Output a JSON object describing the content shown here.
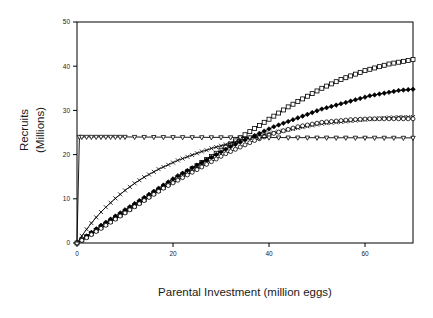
{
  "chart_data": {
    "type": "line",
    "title": "",
    "xlabel": "Parental Investment (million eggs)",
    "ylabel": "Recruits (Millions)",
    "ylabel_line1": "Recruits",
    "ylabel_line2": "(Millions)",
    "xlim": [
      0,
      70
    ],
    "ylim": [
      0,
      50
    ],
    "xticks": [
      0,
      20,
      40,
      60
    ],
    "yticks": [
      0,
      10,
      20,
      30,
      40,
      50
    ],
    "xtick_labels": [
      "0",
      "20",
      "40",
      "60"
    ],
    "ytick_labels": [
      "0",
      "10",
      "20",
      "30",
      "40",
      "50"
    ],
    "grid": false,
    "legend": "none",
    "frame": "box",
    "line_color": "#000000",
    "series": [
      {
        "name": "open-squares",
        "marker": "square-open",
        "x": [
          0,
          1,
          2,
          3,
          4,
          5,
          6,
          7,
          8,
          9,
          10,
          11,
          12,
          13,
          14,
          15,
          16,
          17,
          18,
          19,
          20,
          21,
          22,
          23,
          24,
          25,
          26,
          27,
          28,
          29,
          30,
          31,
          32,
          33,
          34,
          35,
          36,
          37,
          38,
          39,
          40,
          41,
          42,
          43,
          44,
          45,
          46,
          47,
          48,
          49,
          50,
          51,
          52,
          53,
          54,
          55,
          56,
          57,
          58,
          59,
          60,
          61,
          62,
          63,
          64,
          65,
          66,
          67,
          68,
          69,
          70
        ],
        "y": [
          0,
          0.7,
          1.4,
          2.1,
          2.8,
          3.5,
          4.2,
          4.9,
          5.6,
          6.3,
          7.0,
          7.7,
          8.4,
          9.1,
          9.8,
          10.5,
          11.2,
          11.9,
          12.6,
          13.3,
          14.0,
          14.7,
          15.4,
          16.1,
          16.8,
          17.5,
          18.2,
          18.9,
          19.6,
          20.3,
          21.0,
          21.7,
          22.4,
          23.1,
          23.8,
          24.5,
          25.2,
          25.9,
          26.6,
          27.3,
          28.0,
          28.7,
          29.4,
          30.1,
          30.8,
          31.4,
          32.0,
          32.6,
          33.2,
          33.8,
          34.4,
          35.0,
          35.5,
          36.0,
          36.5,
          37.0,
          37.4,
          37.8,
          38.2,
          38.6,
          39.0,
          39.3,
          39.6,
          39.9,
          40.2,
          40.5,
          40.7,
          40.9,
          41.1,
          41.3,
          41.5
        ]
      },
      {
        "name": "filled-diamonds",
        "marker": "diamond-filled",
        "x": [
          0,
          1,
          2,
          3,
          4,
          5,
          6,
          7,
          8,
          9,
          10,
          11,
          12,
          13,
          14,
          15,
          16,
          17,
          18,
          19,
          20,
          21,
          22,
          23,
          24,
          25,
          26,
          27,
          28,
          29,
          30,
          31,
          32,
          33,
          34,
          35,
          36,
          37,
          38,
          39,
          40,
          41,
          42,
          43,
          44,
          45,
          46,
          47,
          48,
          49,
          50,
          51,
          52,
          53,
          54,
          55,
          56,
          57,
          58,
          59,
          60,
          61,
          62,
          63,
          64,
          65,
          66,
          67,
          68,
          69,
          70
        ],
        "y": [
          0,
          0.8,
          1.6,
          2.4,
          3.2,
          4.0,
          4.7,
          5.4,
          6.1,
          6.8,
          7.5,
          8.2,
          8.9,
          9.6,
          10.3,
          11.0,
          11.7,
          12.4,
          13.1,
          13.8,
          14.5,
          15.2,
          15.8,
          16.4,
          17.0,
          17.6,
          18.2,
          18.8,
          19.4,
          20.0,
          20.6,
          21.2,
          21.8,
          22.3,
          22.8,
          23.3,
          23.8,
          24.3,
          24.8,
          25.3,
          25.8,
          26.3,
          26.7,
          27.1,
          27.5,
          27.9,
          28.3,
          28.7,
          29.1,
          29.5,
          29.9,
          30.3,
          30.6,
          30.9,
          31.2,
          31.5,
          31.8,
          32.1,
          32.4,
          32.7,
          33.0,
          33.3,
          33.5,
          33.7,
          33.9,
          34.1,
          34.3,
          34.5,
          34.6,
          34.7,
          34.8
        ]
      },
      {
        "name": "x-crosses",
        "marker": "x-cross",
        "x": [
          0,
          1,
          2,
          3,
          4,
          5,
          6,
          7,
          8,
          9,
          10,
          11,
          12,
          13,
          14,
          15,
          16,
          17,
          18,
          19,
          20,
          21,
          22,
          23,
          24,
          25,
          26,
          27,
          28,
          29,
          30,
          31,
          32,
          33,
          34,
          35,
          36,
          37,
          38,
          39,
          40,
          41,
          42,
          43,
          44,
          45,
          46,
          47,
          48,
          49,
          50,
          51,
          52,
          53,
          54,
          55,
          56,
          57,
          58,
          59,
          60,
          61,
          62,
          63,
          64,
          65,
          66,
          67,
          68,
          69,
          70
        ],
        "y": [
          0,
          1.6,
          3.1,
          4.5,
          5.8,
          7.0,
          8.1,
          9.1,
          10.1,
          11.0,
          11.9,
          12.7,
          13.5,
          14.2,
          14.9,
          15.5,
          16.1,
          16.7,
          17.2,
          17.7,
          18.2,
          18.7,
          19.1,
          19.5,
          19.9,
          20.3,
          20.7,
          21.0,
          21.4,
          21.7,
          22.0,
          22.3,
          22.6,
          22.9,
          23.2,
          23.5,
          23.8,
          24.0,
          24.3,
          24.5,
          24.8,
          25.0,
          25.2,
          25.4,
          25.6,
          25.8,
          26.0,
          26.2,
          26.4,
          26.6,
          26.8,
          27.0,
          27.1,
          27.2,
          27.3,
          27.4,
          27.5,
          27.6,
          27.7,
          27.8,
          27.9,
          28.0,
          28.1,
          28.2,
          28.3,
          28.4,
          28.4,
          28.5,
          28.5,
          28.5,
          28.5
        ]
      },
      {
        "name": "open-circles",
        "marker": "circle-open",
        "x": [
          0,
          1,
          2,
          3,
          4,
          5,
          6,
          7,
          8,
          9,
          10,
          11,
          12,
          13,
          14,
          15,
          16,
          17,
          18,
          19,
          20,
          21,
          22,
          23,
          24,
          25,
          26,
          27,
          28,
          29,
          30,
          31,
          32,
          33,
          34,
          35,
          36,
          37,
          38,
          39,
          40,
          41,
          42,
          43,
          44,
          45,
          46,
          47,
          48,
          49,
          50,
          51,
          52,
          53,
          54,
          55,
          56,
          57,
          58,
          59,
          60,
          61,
          62,
          63,
          64,
          65,
          66,
          67,
          68,
          69,
          70
        ],
        "y": [
          0,
          0.6,
          1.2,
          1.9,
          2.6,
          3.3,
          4.0,
          4.7,
          5.4,
          6.1,
          6.8,
          7.5,
          8.2,
          8.9,
          9.6,
          10.3,
          11.0,
          11.7,
          12.4,
          13.0,
          13.6,
          14.2,
          14.8,
          15.4,
          16.0,
          16.6,
          17.2,
          17.8,
          18.4,
          19.0,
          19.6,
          20.2,
          20.7,
          21.2,
          21.7,
          22.2,
          22.7,
          23.2,
          23.6,
          24.0,
          24.4,
          24.8,
          25.1,
          25.4,
          25.7,
          26.0,
          26.3,
          26.5,
          26.7,
          26.9,
          27.1,
          27.3,
          27.4,
          27.5,
          27.6,
          27.7,
          27.8,
          27.9,
          27.95,
          28.0,
          28.05,
          28.1,
          28.1,
          28.1,
          28.1,
          28.1,
          28.1,
          28.1,
          28.1,
          28.1,
          28.1
        ]
      },
      {
        "name": "open-triangles-flat",
        "marker": "triangle-down-open",
        "x": [
          0,
          0.5,
          1,
          2,
          3,
          4,
          5,
          6,
          7,
          8,
          9,
          10,
          12,
          14,
          16,
          18,
          20,
          22,
          24,
          26,
          28,
          30,
          32,
          34,
          36,
          38,
          40,
          42,
          44,
          46,
          48,
          50,
          52,
          54,
          56,
          58,
          60,
          62,
          64,
          66,
          68,
          70
        ],
        "y": [
          0,
          24.0,
          24.0,
          24.0,
          24.0,
          24.0,
          24.0,
          24.0,
          24.0,
          24.0,
          24.0,
          24.0,
          23.98,
          23.97,
          23.96,
          23.95,
          23.94,
          23.93,
          23.92,
          23.91,
          23.9,
          23.9,
          23.89,
          23.88,
          23.87,
          23.86,
          23.85,
          23.85,
          23.84,
          23.84,
          23.83,
          23.82,
          23.82,
          23.81,
          23.81,
          23.8,
          23.8,
          23.8,
          23.79,
          23.79,
          23.78,
          23.78
        ]
      }
    ]
  }
}
